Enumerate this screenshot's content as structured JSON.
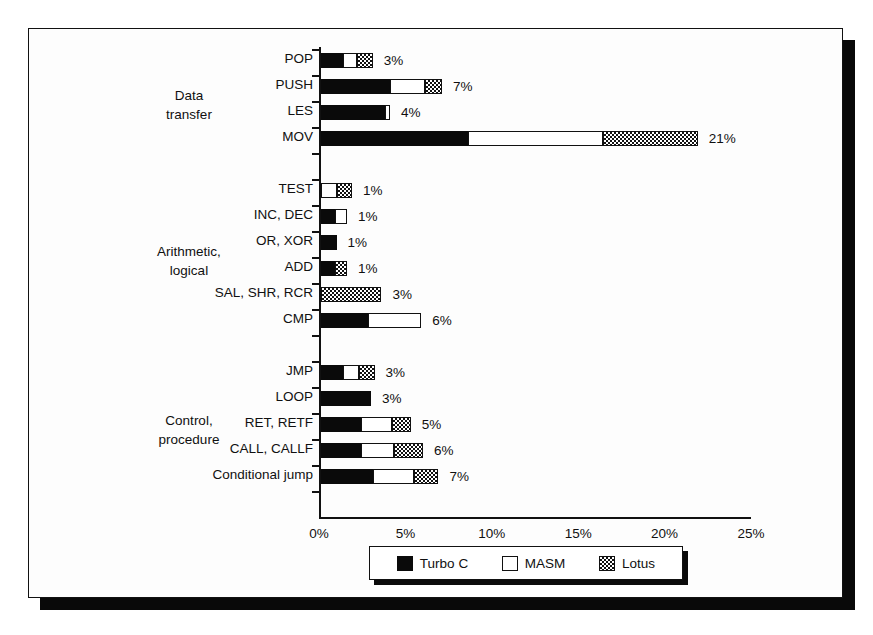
{
  "chart_data": {
    "type": "bar",
    "orientation": "horizontal",
    "stacked": true,
    "title": "",
    "xlabel": "",
    "ylabel": "",
    "xlim": [
      0,
      25
    ],
    "grid": false,
    "legend_position": "bottom",
    "xtick_labels": [
      "0%",
      "5%",
      "10%",
      "15%",
      "20%",
      "25%"
    ],
    "xtick_values": [
      0,
      5,
      10,
      15,
      20,
      25
    ],
    "series": [
      {
        "name": "Turbo C",
        "fill": "solid-black",
        "color": "#0a0a0a"
      },
      {
        "name": "MASM",
        "fill": "white",
        "color": "#ffffff"
      },
      {
        "name": "Lotus",
        "fill": "checker-gray",
        "color": "#808080"
      }
    ],
    "groups": [
      {
        "label_lines": [
          "Data",
          "transfer"
        ],
        "categories": [
          {
            "label": "POP",
            "total_label": "3%",
            "values": [
              1.3,
              0.8,
              0.9
            ]
          },
          {
            "label": "PUSH",
            "total_label": "7%",
            "values": [
              4.0,
              2.0,
              1.0
            ]
          },
          {
            "label": "LES",
            "total_label": "4%",
            "values": [
              3.7,
              0.3,
              0.0
            ]
          },
          {
            "label": "MOV",
            "total_label": "21%",
            "values": [
              8.5,
              7.8,
              5.5
            ]
          }
        ]
      },
      {
        "label_lines": [
          "Arithmetic,",
          "logical"
        ],
        "categories": [
          {
            "label": "TEST",
            "total_label": "1%",
            "values": [
              0.0,
              0.9,
              0.9
            ]
          },
          {
            "label": "INC, DEC",
            "total_label": "1%",
            "values": [
              0.8,
              0.7,
              0.0
            ]
          },
          {
            "label": "OR, XOR",
            "total_label": "1%",
            "values": [
              0.9,
              0.0,
              0.0
            ]
          },
          {
            "label": "ADD",
            "total_label": "1%",
            "values": [
              0.8,
              0.0,
              0.7
            ]
          },
          {
            "label": "SAL, SHR, RCR",
            "total_label": "3%",
            "values": [
              0.0,
              0.0,
              3.5
            ]
          },
          {
            "label": "CMP",
            "total_label": "6%",
            "values": [
              2.7,
              3.1,
              0.0
            ]
          }
        ]
      },
      {
        "label_lines": [
          "Control,",
          "procedure"
        ],
        "categories": [
          {
            "label": "JMP",
            "total_label": "3%",
            "values": [
              1.3,
              0.9,
              0.9
            ]
          },
          {
            "label": "LOOP",
            "total_label": "3%",
            "values": [
              2.9,
              0.0,
              0.0
            ]
          },
          {
            "label": "RET, RETF",
            "total_label": "5%",
            "values": [
              2.3,
              1.8,
              1.1
            ]
          },
          {
            "label": "CALL, CALLF",
            "total_label": "6%",
            "values": [
              2.3,
              1.9,
              1.7
            ]
          },
          {
            "label": "Conditional jump",
            "total_label": "7%",
            "values": [
              3.0,
              2.4,
              1.4
            ]
          }
        ]
      }
    ]
  },
  "legend": {
    "items": [
      {
        "label": "Turbo C"
      },
      {
        "label": "MASM"
      },
      {
        "label": "Lotus"
      }
    ]
  }
}
